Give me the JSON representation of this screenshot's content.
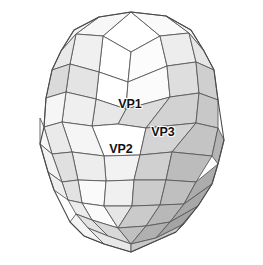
{
  "figure": {
    "name": "zonohedron-diagram",
    "title": "",
    "background_color": "#ffffff",
    "edge_color": "#5a5a5a",
    "label_color": "#111111"
  },
  "labels": [
    {
      "id": "vp1",
      "text": "VP1",
      "x": 130,
      "y": 108
    },
    {
      "id": "vp2",
      "text": "VP2",
      "x": 121,
      "y": 153
    },
    {
      "id": "vp3",
      "text": "VP3",
      "x": 163,
      "y": 136
    }
  ],
  "palette": {
    "white": "#ffffff",
    "very_light": "#f4f4f4",
    "light": "#ececec",
    "light_mid": "#e2e2e2",
    "mid": "#d6d6d6",
    "mid_dark": "#c6c6c6",
    "dark": "#b4b4b4",
    "darker": "#a2a2a2",
    "darkest": "#8e8e8e"
  },
  "faces": [
    {
      "id": "f001",
      "fill": "#ffffff",
      "points": "131,12 103,36 131,52 160,36"
    },
    {
      "id": "f002",
      "fill": "#fafafa",
      "points": "131,12 160,36 189,33 166,16"
    },
    {
      "id": "f003",
      "fill": "#f7f7f7",
      "points": "131,12 103,36 76,34 99,17"
    },
    {
      "id": "f004",
      "fill": "#f2f2f2",
      "points": "99,17 76,34 61,51 74,30"
    },
    {
      "id": "f005",
      "fill": "#f4f4f4",
      "points": "166,16 189,33 204,51 191,30"
    },
    {
      "id": "f006",
      "fill": "#ffffff",
      "points": "103,36 131,52 128,82 99,72"
    },
    {
      "id": "f007",
      "fill": "#fcfcfc",
      "points": "131,52 160,36 167,66 128,82"
    },
    {
      "id": "f008",
      "fill": "#f0f0f0",
      "points": "103,36 99,72 70,64 76,34"
    },
    {
      "id": "f009",
      "fill": "#ededed",
      "points": "160,36 189,33 196,62 167,66"
    },
    {
      "id": "f010",
      "fill": "#e9e9e9",
      "points": "76,34 70,64 52,70 61,51"
    },
    {
      "id": "f011",
      "fill": "#e6e6e6",
      "points": "189,33 204,51 214,70 196,62"
    },
    {
      "id": "f012",
      "fill": "#ffffff",
      "points": "99,72 128,82 126,109 96,99"
    },
    {
      "id": "f013",
      "fill": "#fbfbfb",
      "points": "128,82 167,66 170,97 126,109"
    },
    {
      "id": "f014",
      "fill": "#e4e4e4",
      "points": "99,72 96,99 66,92 70,64"
    },
    {
      "id": "f015",
      "fill": "#dedede",
      "points": "167,66 196,62 199,93 170,97"
    },
    {
      "id": "f016",
      "fill": "#dadada",
      "points": "70,64 66,92 46,98 52,70"
    },
    {
      "id": "f017",
      "fill": "#cfcfcf",
      "points": "196,62 214,70 218,100 199,93"
    },
    {
      "id": "f018",
      "fill": "#dcdcdc",
      "points": "126,109 170,97 146,128 118,124"
    },
    {
      "id": "f019",
      "fill": "#e8e8e8",
      "points": "96,99 126,109 118,124 92,126"
    },
    {
      "id": "f020",
      "fill": "#efefef",
      "points": "66,92 96,99 92,126 62,122"
    },
    {
      "id": "f021",
      "fill": "#d2d2d2",
      "points": "170,97 199,93 196,123 146,128"
    },
    {
      "id": "f022",
      "fill": "#c8c8c8",
      "points": "199,93 218,100 218,128 196,123"
    },
    {
      "id": "f023",
      "fill": "#f6f6f6",
      "points": "46,98 66,92 62,122 44,127"
    },
    {
      "id": "f024",
      "fill": "#ffffff",
      "points": "92,126 118,124 146,128 140,155 104,156"
    },
    {
      "id": "f025",
      "fill": "#f5f5f5",
      "points": "62,122 92,126 104,156 72,152"
    },
    {
      "id": "f026",
      "fill": "#d4d4d4",
      "points": "146,128 196,123 172,152 140,155"
    },
    {
      "id": "f027",
      "fill": "#c4c4c4",
      "points": "196,123 218,128 212,156 172,152"
    },
    {
      "id": "f028",
      "fill": "#eaeaea",
      "points": "44,127 62,122 72,152 52,154"
    },
    {
      "id": "f029",
      "fill": "#f2f2f2",
      "points": "104,156 140,155 134,180 106,181"
    },
    {
      "id": "f030",
      "fill": "#ededed",
      "points": "72,152 104,156 106,181 78,180"
    },
    {
      "id": "f031",
      "fill": "#d0d0d0",
      "points": "140,155 172,152 166,180 134,180"
    },
    {
      "id": "f032",
      "fill": "#bcbcbc",
      "points": "172,152 212,156 196,182 166,180"
    },
    {
      "id": "f033",
      "fill": "#e0e0e0",
      "points": "52,154 72,152 78,180 62,182"
    },
    {
      "id": "f034",
      "fill": "#b4b4b4",
      "points": "212,156 218,128 224,140 218,164"
    },
    {
      "id": "f035",
      "fill": "#f8f8f8",
      "points": "44,127 52,154 40,144 40,118"
    },
    {
      "id": "f036",
      "fill": "#fafafa",
      "points": "78,180 106,181 104,206 82,203"
    },
    {
      "id": "f037",
      "fill": "#f0f0f0",
      "points": "106,181 134,180 132,206 104,206"
    },
    {
      "id": "f038",
      "fill": "#cccccc",
      "points": "134,180 166,180 160,205 132,206"
    },
    {
      "id": "f039",
      "fill": "#bfbfbf",
      "points": "166,180 196,182 184,204 160,205"
    },
    {
      "id": "f040",
      "fill": "#e2e2e2",
      "points": "62,182 78,180 82,203 68,200"
    },
    {
      "id": "f041",
      "fill": "#acacac",
      "points": "196,182 218,164 212,184 184,204"
    },
    {
      "id": "f042",
      "fill": "#f2f2f2",
      "points": "52,154 62,182 48,172 40,144"
    },
    {
      "id": "f043",
      "fill": "#fbfbfb",
      "points": "82,203 104,206 118,228 92,220"
    },
    {
      "id": "f044",
      "fill": "#e6e6e6",
      "points": "104,206 132,206 118,228"
    },
    {
      "id": "f045",
      "fill": "#cacaca",
      "points": "132,206 160,205 146,226 118,228"
    },
    {
      "id": "f046",
      "fill": "#b8b8b8",
      "points": "160,205 184,204 170,222 146,226"
    },
    {
      "id": "f047",
      "fill": "#ececec",
      "points": "68,200 82,203 92,220 76,214"
    },
    {
      "id": "f048",
      "fill": "#a8a8a8",
      "points": "184,204 212,184 198,206 170,222"
    },
    {
      "id": "f049",
      "fill": "#eeeeee",
      "points": "48,172 62,182 68,200 54,190"
    },
    {
      "id": "f050",
      "fill": "#d8d8d8",
      "points": "92,220 118,228 131,244 108,236"
    },
    {
      "id": "f051",
      "fill": "#c0c0c0",
      "points": "118,228 146,226 131,244"
    },
    {
      "id": "f052",
      "fill": "#b0b0b0",
      "points": "146,226 170,222 156,238 131,244"
    },
    {
      "id": "f053",
      "fill": "#dededede",
      "points": "76,214 92,220 108,236 88,228"
    },
    {
      "id": "f054",
      "fill": "#a4a4a4",
      "points": "170,222 198,206 184,224 156,238"
    },
    {
      "id": "f055",
      "fill": "#e8e8e8",
      "points": "88,228 108,236 131,244 131,252 104,244"
    },
    {
      "id": "f056",
      "fill": "#c8c8c8",
      "points": "131,244 156,238 184,224 176,232 131,252"
    },
    {
      "id": "f057",
      "fill": "#f4f4f4",
      "points": "76,214 88,228 104,244 84,236 70,222"
    }
  ],
  "edges": [
    {
      "id": "e001",
      "points": "131,12 99,17 74,30 61,51 52,70 46,98 44,127 40,144 48,172 54,190 70,222 84,236 104,244 131,252 176,232 198,206 212,184 218,164 224,140 218,100 214,70 204,51 191,30 166,16 131,12"
    }
  ]
}
